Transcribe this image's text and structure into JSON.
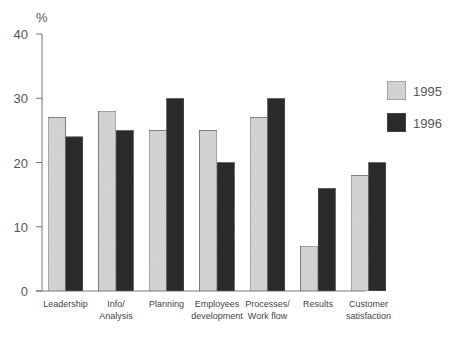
{
  "chart_data": {
    "type": "bar",
    "title": "",
    "ylabel": "%",
    "xlabel": "",
    "ylim": [
      0,
      40
    ],
    "yticks": [
      0,
      10,
      20,
      30,
      40
    ],
    "grid": false,
    "legend_position": "right",
    "categories": [
      [
        "Leadership"
      ],
      [
        "Info/",
        "Analysis"
      ],
      [
        "Planning"
      ],
      [
        "Employees",
        "development"
      ],
      [
        "Processes/",
        "Work flow"
      ],
      [
        "Results"
      ],
      [
        "Customer",
        "satisfaction"
      ]
    ],
    "series": [
      {
        "name": "1995",
        "color": "#d6d6d6",
        "values": [
          27,
          28,
          25,
          25,
          27,
          7,
          18
        ]
      },
      {
        "name": "1996",
        "color": "#2b2b2b",
        "values": [
          24,
          25,
          30,
          20,
          30,
          16,
          20
        ]
      }
    ]
  }
}
